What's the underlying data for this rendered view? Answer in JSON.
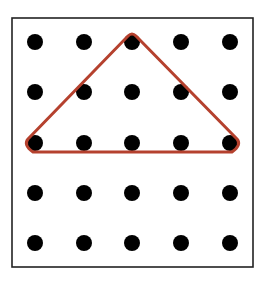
{
  "diagram": {
    "type": "geoboard",
    "grid": {
      "rows": 5,
      "cols": 5
    },
    "dot_x": [
      35,
      84,
      132,
      181,
      230
    ],
    "dot_y": [
      42,
      92,
      143,
      193,
      243
    ],
    "dot_radius": 8,
    "dot_color": "#000000",
    "border": {
      "x": 12,
      "y": 18,
      "width": 241,
      "height": 249,
      "color": "#222222"
    },
    "band": {
      "shape": "triangle",
      "color": "#b5412e",
      "vertices_grid": [
        [
          0,
          2
        ],
        [
          2,
          0
        ],
        [
          4,
          2
        ]
      ]
    }
  }
}
